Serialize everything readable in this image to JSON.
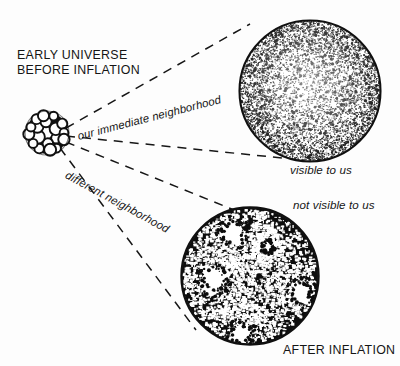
{
  "figure": {
    "background_color": "#fdfdfd",
    "ink_color": "#111111",
    "width": 400,
    "height": 366
  },
  "labels": {
    "early_universe_line1": "EARLY UNIVERSE",
    "early_universe_line2": "BEFORE INFLATION",
    "our_immediate_neighborhood": "our immediate neighborhood",
    "different_neighborhood": "different neighborhood",
    "visible_to_us": "visible to us",
    "not_visible_to_us": "not visible to us",
    "after_inflation": "AFTER INFLATION"
  },
  "shapes": {
    "early_cluster": {
      "name": "bubble-cluster",
      "center_x": 47,
      "center_y": 133,
      "radius": 22,
      "bubble_count": 19,
      "stroke_color": "#111111",
      "fill_color": "#ffffff"
    },
    "visible_circle": {
      "name": "uniform-stipple-circle",
      "center_x": 310,
      "center_y": 91,
      "radius": 71,
      "texture": "fine uniform stipple",
      "density": 0.46,
      "stroke_color": "#111111"
    },
    "not_visible_circle": {
      "name": "blotchy-dark-circle",
      "center_x": 250,
      "center_y": 276,
      "radius": 69,
      "texture": "coarse dark mottle with white voids",
      "density": 0.78,
      "stroke_color": "#111111",
      "voids": [
        {
          "x": 233,
          "y": 233,
          "r": 15
        },
        {
          "x": 214,
          "y": 279,
          "r": 16
        },
        {
          "x": 301,
          "y": 292,
          "r": 14
        },
        {
          "x": 241,
          "y": 334,
          "r": 14
        },
        {
          "x": 268,
          "y": 247,
          "r": 7
        }
      ]
    }
  },
  "cones": {
    "upper": {
      "name": "visible-cone",
      "apex_x": 66,
      "apex_y": 128,
      "top_end_x": 250,
      "top_end_y": 24,
      "bottom_end_x": 282,
      "bottom_end_y": 158
    },
    "lower": {
      "name": "not-visible-cone",
      "apex_x": 66,
      "apex_y": 142,
      "top_end_x": 234,
      "top_end_y": 210,
      "bottom_end_x": 196,
      "bottom_end_y": 330
    }
  },
  "style": {
    "dash_pattern": "9 7",
    "dash_width": 1.5
  }
}
